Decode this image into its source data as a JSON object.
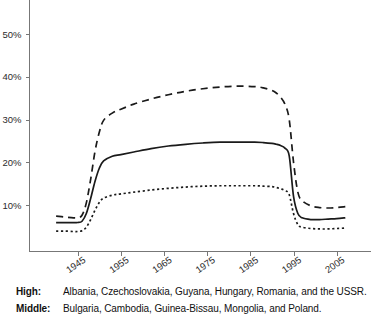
{
  "chart_data": {
    "type": "line",
    "title": "",
    "xlabel": "",
    "ylabel": "",
    "xlim": [
      1940,
      2008
    ],
    "ylim": [
      0,
      58
    ],
    "grid": false,
    "legend_position": "below-plot",
    "y_ticks": [
      10,
      20,
      30,
      40,
      50
    ],
    "y_tick_labels": [
      "10%",
      "20%",
      "30%",
      "40%",
      "50%"
    ],
    "x_ticks": [
      1945,
      1955,
      1965,
      1975,
      1985,
      1995,
      2005
    ],
    "x_tick_labels": [
      "1945",
      "1955",
      "1965",
      "1975",
      "1985",
      "1995",
      "2005"
    ],
    "series": [
      {
        "name": "High",
        "style": "dashed",
        "color": "#1a1a1a",
        "x": [
          1940,
          1942,
          1944,
          1945,
          1946,
          1947,
          1948,
          1949,
          1950,
          1951,
          1953,
          1955,
          1958,
          1962,
          1966,
          1970,
          1974,
          1978,
          1982,
          1986,
          1988,
          1990,
          1991,
          1992,
          1993,
          1994,
          1995,
          1996,
          1997,
          1999,
          2001,
          2003,
          2005,
          2007
        ],
        "y": [
          7.4,
          7.2,
          7.0,
          7.0,
          7.6,
          10.5,
          16.0,
          22.5,
          27.0,
          29.8,
          31.5,
          32.4,
          33.6,
          34.8,
          35.8,
          36.6,
          37.2,
          37.6,
          37.8,
          37.7,
          37.4,
          36.8,
          36.2,
          35.2,
          33.6,
          30.0,
          20.0,
          13.0,
          11.0,
          9.8,
          9.4,
          9.3,
          9.4,
          9.6
        ]
      },
      {
        "name": "Middle",
        "style": "solid",
        "color": "#1a1a1a",
        "x": [
          1940,
          1942,
          1944,
          1945,
          1946,
          1947,
          1948,
          1949,
          1950,
          1951,
          1953,
          1955,
          1958,
          1962,
          1966,
          1970,
          1974,
          1978,
          1982,
          1986,
          1988,
          1990,
          1991,
          1992,
          1993,
          1994,
          1995,
          1996,
          1997,
          1999,
          2001,
          2003,
          2005,
          2007
        ],
        "y": [
          5.9,
          5.9,
          5.9,
          5.9,
          6.2,
          8.0,
          11.5,
          15.5,
          18.6,
          20.3,
          21.4,
          21.8,
          22.4,
          23.2,
          23.8,
          24.2,
          24.5,
          24.7,
          24.7,
          24.7,
          24.6,
          24.4,
          24.2,
          23.9,
          23.3,
          21.5,
          12.0,
          8.0,
          7.0,
          6.6,
          6.6,
          6.7,
          6.8,
          7.0
        ]
      },
      {
        "name": "Low",
        "style": "dotted",
        "color": "#1a1a1a",
        "x": [
          1940,
          1942,
          1944,
          1945,
          1946,
          1947,
          1948,
          1949,
          1950,
          1951,
          1953,
          1955,
          1958,
          1962,
          1966,
          1970,
          1974,
          1978,
          1982,
          1986,
          1988,
          1990,
          1991,
          1992,
          1993,
          1994,
          1995,
          1996,
          1997,
          1999,
          2001,
          2003,
          2005,
          2007
        ],
        "y": [
          3.9,
          3.9,
          3.8,
          3.8,
          4.0,
          4.8,
          6.6,
          8.8,
          10.6,
          11.6,
          12.3,
          12.6,
          13.0,
          13.5,
          13.9,
          14.2,
          14.4,
          14.5,
          14.5,
          14.5,
          14.4,
          14.3,
          14.1,
          13.8,
          13.4,
          12.4,
          8.0,
          5.4,
          4.8,
          4.5,
          4.4,
          4.4,
          4.5,
          4.6
        ]
      }
    ]
  },
  "legend": {
    "rows": [
      {
        "key": "High:",
        "text": "Albania, Czechoslovakia, Guyana, Hungary, Romania, and the USSR."
      },
      {
        "key": "Middle:",
        "text": "Bulgaria, Cambodia, Guinea-Bissau, Mongolia, and Poland."
      }
    ]
  }
}
